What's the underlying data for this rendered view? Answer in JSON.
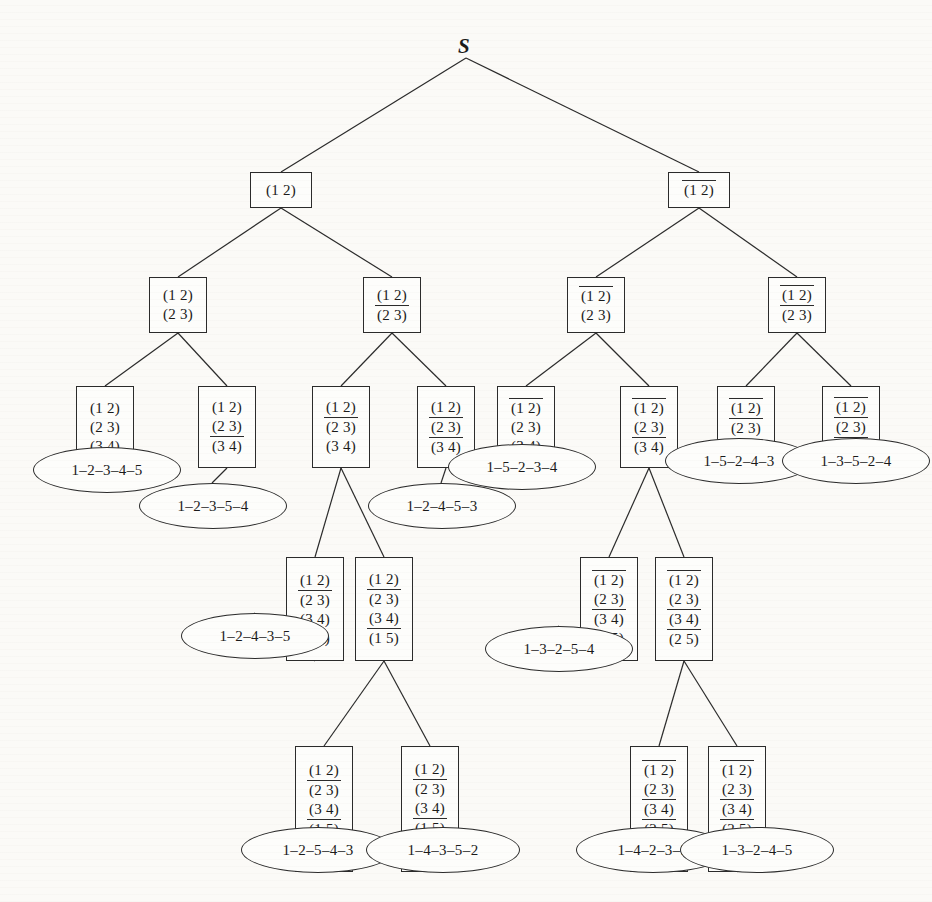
{
  "figure": {
    "type": "search-tree-diagram",
    "root_label": "S",
    "notation": {
      "overline_means": "negated literal",
      "literal_format": "(i j)"
    }
  },
  "nodes": [
    {
      "id": "n0",
      "label": "S",
      "kind": "root",
      "x": 466,
      "y": 48,
      "literals": []
    },
    {
      "id": "n1",
      "kind": "box",
      "x": 250,
      "y": 172,
      "w": 62,
      "h": 36,
      "literals": [
        {
          "t": "(1 2)",
          "neg": false
        }
      ]
    },
    {
      "id": "n2",
      "kind": "box",
      "x": 668,
      "y": 172,
      "w": 62,
      "h": 36,
      "literals": [
        {
          "t": "(1 2)",
          "neg": true
        }
      ]
    },
    {
      "id": "n3",
      "kind": "box",
      "x": 149,
      "y": 277,
      "w": 58,
      "h": 56,
      "literals": [
        {
          "t": "(1 2)",
          "neg": false
        },
        {
          "t": "(2 3)",
          "neg": false
        }
      ]
    },
    {
      "id": "n4",
      "kind": "box",
      "x": 363,
      "y": 277,
      "w": 58,
      "h": 56,
      "literals": [
        {
          "t": "(1 2)",
          "neg": false
        },
        {
          "t": "(2 3)",
          "neg": true
        }
      ]
    },
    {
      "id": "n5",
      "kind": "box",
      "x": 567,
      "y": 277,
      "w": 58,
      "h": 56,
      "literals": [
        {
          "t": "(1 2)",
          "neg": true
        },
        {
          "t": "(2 3)",
          "neg": false
        }
      ]
    },
    {
      "id": "n6",
      "kind": "box",
      "x": 768,
      "y": 277,
      "w": 58,
      "h": 56,
      "literals": [
        {
          "t": "(1 2)",
          "neg": true
        },
        {
          "t": "(2 3)",
          "neg": true
        }
      ]
    },
    {
      "id": "n7",
      "kind": "box",
      "x": 76,
      "y": 386,
      "w": 58,
      "h": 82,
      "literals": [
        {
          "t": "(1 2)",
          "neg": false
        },
        {
          "t": "(2 3)",
          "neg": false
        },
        {
          "t": "(3 4)",
          "neg": false
        }
      ]
    },
    {
      "id": "n8",
      "kind": "box",
      "x": 198,
      "y": 386,
      "w": 58,
      "h": 82,
      "literals": [
        {
          "t": "(1 2)",
          "neg": false
        },
        {
          "t": "(2 3)",
          "neg": false
        },
        {
          "t": "(3 4)",
          "neg": true
        }
      ]
    },
    {
      "id": "n9",
      "kind": "box",
      "x": 312,
      "y": 386,
      "w": 58,
      "h": 82,
      "literals": [
        {
          "t": "(1 2)",
          "neg": false
        },
        {
          "t": "(2 3)",
          "neg": true
        },
        {
          "t": "(3 4)",
          "neg": false
        }
      ]
    },
    {
      "id": "n10",
      "kind": "box",
      "x": 417,
      "y": 386,
      "w": 58,
      "h": 82,
      "literals": [
        {
          "t": "(1 2)",
          "neg": false
        },
        {
          "t": "(2 3)",
          "neg": true
        },
        {
          "t": "(3 4)",
          "neg": true
        }
      ]
    },
    {
      "id": "n11",
      "kind": "box",
      "x": 497,
      "y": 386,
      "w": 58,
      "h": 82,
      "literals": [
        {
          "t": "(1 2)",
          "neg": true
        },
        {
          "t": "(2 3)",
          "neg": false
        },
        {
          "t": "(3 4)",
          "neg": false
        }
      ]
    },
    {
      "id": "n12",
      "kind": "box",
      "x": 620,
      "y": 386,
      "w": 58,
      "h": 82,
      "literals": [
        {
          "t": "(1 2)",
          "neg": true
        },
        {
          "t": "(2 3)",
          "neg": false
        },
        {
          "t": "(3 4)",
          "neg": true
        }
      ]
    },
    {
      "id": "n13",
      "kind": "box",
      "x": 717,
      "y": 386,
      "w": 58,
      "h": 82,
      "literals": [
        {
          "t": "(1 2)",
          "neg": true
        },
        {
          "t": "(2 3)",
          "neg": true
        },
        {
          "t": "(3 4)",
          "neg": false
        }
      ]
    },
    {
      "id": "n14",
      "kind": "box",
      "x": 822,
      "y": 386,
      "w": 58,
      "h": 82,
      "literals": [
        {
          "t": "(1 2)",
          "neg": true
        },
        {
          "t": "(2 3)",
          "neg": true
        },
        {
          "t": "(3 4)",
          "neg": true
        }
      ]
    },
    {
      "id": "n15",
      "kind": "box",
      "x": 286,
      "y": 557,
      "w": 58,
      "h": 104,
      "literals": [
        {
          "t": "(1 2)",
          "neg": false
        },
        {
          "t": "(2 3)",
          "neg": true
        },
        {
          "t": "(3 4)",
          "neg": false
        },
        {
          "t": "(1 5)",
          "neg": false
        }
      ]
    },
    {
      "id": "n16",
      "kind": "box",
      "x": 355,
      "y": 557,
      "w": 58,
      "h": 104,
      "literals": [
        {
          "t": "(1 2)",
          "neg": false
        },
        {
          "t": "(2 3)",
          "neg": true
        },
        {
          "t": "(3 4)",
          "neg": false
        },
        {
          "t": "(1 5)",
          "neg": true
        }
      ]
    },
    {
      "id": "n17",
      "kind": "box",
      "x": 580,
      "y": 557,
      "w": 58,
      "h": 104,
      "literals": [
        {
          "t": "(1 2)",
          "neg": true
        },
        {
          "t": "(2 3)",
          "neg": false
        },
        {
          "t": "(3 4)",
          "neg": true
        },
        {
          "t": "(2 5)",
          "neg": false
        }
      ]
    },
    {
      "id": "n18",
      "kind": "box",
      "x": 655,
      "y": 557,
      "w": 58,
      "h": 104,
      "literals": [
        {
          "t": "(1 2)",
          "neg": true
        },
        {
          "t": "(2 3)",
          "neg": false
        },
        {
          "t": "(3 4)",
          "neg": true
        },
        {
          "t": "(2 5)",
          "neg": true
        }
      ]
    },
    {
      "id": "n19",
      "kind": "box",
      "x": 295,
      "y": 746,
      "w": 58,
      "h": 126,
      "literals": [
        {
          "t": "(1 2)",
          "neg": false
        },
        {
          "t": "(2 3)",
          "neg": true
        },
        {
          "t": "(3 4)",
          "neg": false
        },
        {
          "t": "(1 5)",
          "neg": true
        },
        {
          "t": "(1 3)",
          "neg": false
        }
      ]
    },
    {
      "id": "n20",
      "kind": "box",
      "x": 401,
      "y": 746,
      "w": 58,
      "h": 126,
      "literals": [
        {
          "t": "(1 2)",
          "neg": false
        },
        {
          "t": "(2 3)",
          "neg": true
        },
        {
          "t": "(3 4)",
          "neg": false
        },
        {
          "t": "(1 5)",
          "neg": true
        },
        {
          "t": "(1 3)",
          "neg": true
        }
      ]
    },
    {
      "id": "n21",
      "kind": "box",
      "x": 630,
      "y": 746,
      "w": 58,
      "h": 126,
      "literals": [
        {
          "t": "(1 2)",
          "neg": true
        },
        {
          "t": "(2 3)",
          "neg": false
        },
        {
          "t": "(3 4)",
          "neg": true
        },
        {
          "t": "(2 5)",
          "neg": true
        },
        {
          "t": "(1 4)",
          "neg": false
        }
      ]
    },
    {
      "id": "n22",
      "kind": "box",
      "x": 708,
      "y": 746,
      "w": 58,
      "h": 126,
      "literals": [
        {
          "t": "(1 2)",
          "neg": true
        },
        {
          "t": "(2 3)",
          "neg": false
        },
        {
          "t": "(3 4)",
          "neg": true
        },
        {
          "t": "(2 5)",
          "neg": true
        },
        {
          "t": "(1 4)",
          "neg": true
        }
      ]
    }
  ],
  "leaves": [
    {
      "id": "l1",
      "label": "1–2–3–4–5",
      "cx": 106,
      "cy": 469,
      "w": 146,
      "h": 44
    },
    {
      "id": "l2",
      "label": "1–2–3–5–4",
      "cx": 212,
      "cy": 505,
      "w": 146,
      "h": 44
    },
    {
      "id": "l3",
      "label": "1–2–4–5–3",
      "cx": 441,
      "cy": 505,
      "w": 146,
      "h": 44
    },
    {
      "id": "l4",
      "label": "1–5–2–3–4",
      "cx": 521,
      "cy": 466,
      "w": 146,
      "h": 44
    },
    {
      "id": "l5",
      "label": "1–5–2–4–3",
      "cx": 738,
      "cy": 460,
      "w": 146,
      "h": 44
    },
    {
      "id": "l6",
      "label": "1–3–5–2–4",
      "cx": 855,
      "cy": 460,
      "w": 146,
      "h": 44
    },
    {
      "id": "l7",
      "label": "1–2–4–3–5",
      "cx": 254,
      "cy": 635,
      "w": 146,
      "h": 44
    },
    {
      "id": "l8",
      "label": "1–3–2–5–4",
      "cx": 558,
      "cy": 648,
      "w": 146,
      "h": 44
    },
    {
      "id": "l9",
      "label": "1–2–5–4–3",
      "cx": 317,
      "cy": 849,
      "w": 152,
      "h": 44
    },
    {
      "id": "l10",
      "label": "1–4–3–5–2",
      "cx": 442,
      "cy": 849,
      "w": 152,
      "h": 44
    },
    {
      "id": "l11",
      "label": "1–4–2–3–5",
      "cx": 652,
      "cy": 849,
      "w": 152,
      "h": 44
    },
    {
      "id": "l12",
      "label": "1–3–2–4–5",
      "cx": 756,
      "cy": 849,
      "w": 152,
      "h": 44
    }
  ],
  "edges": [
    {
      "from": "n0",
      "to": "n1"
    },
    {
      "from": "n0",
      "to": "n2"
    },
    {
      "from": "n1",
      "to": "n3"
    },
    {
      "from": "n1",
      "to": "n4"
    },
    {
      "from": "n2",
      "to": "n5"
    },
    {
      "from": "n2",
      "to": "n6"
    },
    {
      "from": "n3",
      "to": "n7"
    },
    {
      "from": "n3",
      "to": "n8"
    },
    {
      "from": "n4",
      "to": "n9"
    },
    {
      "from": "n4",
      "to": "n10"
    },
    {
      "from": "n5",
      "to": "n11"
    },
    {
      "from": "n5",
      "to": "n12"
    },
    {
      "from": "n6",
      "to": "n13"
    },
    {
      "from": "n6",
      "to": "n14"
    },
    {
      "from": "n7",
      "to": "l1"
    },
    {
      "from": "n8",
      "to": "l2"
    },
    {
      "from": "n9",
      "to": "n15"
    },
    {
      "from": "n9",
      "to": "n16"
    },
    {
      "from": "n10",
      "to": "l3"
    },
    {
      "from": "n11",
      "to": "l4"
    },
    {
      "from": "n12",
      "to": "n17"
    },
    {
      "from": "n12",
      "to": "n18"
    },
    {
      "from": "n13",
      "to": "l5"
    },
    {
      "from": "n14",
      "to": "l6"
    },
    {
      "from": "n15",
      "to": "l7"
    },
    {
      "from": "n16",
      "to": "n19"
    },
    {
      "from": "n16",
      "to": "n20"
    },
    {
      "from": "n17",
      "to": "l8"
    },
    {
      "from": "n18",
      "to": "n21"
    },
    {
      "from": "n18",
      "to": "n22"
    },
    {
      "from": "n19",
      "to": "l9"
    },
    {
      "from": "n20",
      "to": "l10"
    },
    {
      "from": "n21",
      "to": "l11"
    },
    {
      "from": "n22",
      "to": "l12"
    }
  ]
}
